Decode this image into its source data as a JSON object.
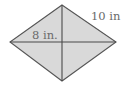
{
  "diagram": {
    "type": "rhombus-with-diagonals",
    "vertices": {
      "top": [
        62,
        5
      ],
      "right": [
        116,
        42
      ],
      "bottom": [
        62,
        81
      ],
      "left": [
        10,
        42
      ]
    },
    "labels": {
      "half_diagonal": {
        "text": "8 in.",
        "x": 32,
        "y": 39
      },
      "side": {
        "text": "10 in",
        "x": 91,
        "y": 20
      }
    },
    "colors": {
      "fill": "#d9d9d9",
      "stroke": "#555555",
      "diagonal": "#4a4a4a",
      "label": "#6a6a6a"
    }
  }
}
